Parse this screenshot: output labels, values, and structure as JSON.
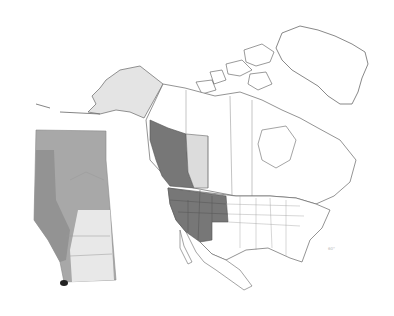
{
  "map": {
    "title": "",
    "region": "North America",
    "colors": {
      "background": "#ffffff",
      "land": "#ffffff",
      "border": "#888888",
      "range_primary": "#777777",
      "range_secondary": "#dcdcdc",
      "alaska": "#e4e4e4",
      "inset_forest": "#a8a8a8",
      "inset_mountain": "#939393",
      "inset_prairie": "#e8e8e8",
      "inset_occurrence": "#222222"
    },
    "range_regions": [
      "British Columbia",
      "Washington",
      "Oregon",
      "California",
      "Idaho",
      "Nevada",
      "Utah",
      "Arizona",
      "Montana",
      "Wyoming",
      "Colorado"
    ],
    "secondary_regions": [
      "Alberta",
      "Alaska"
    ],
    "inset": {
      "region": "Alberta",
      "occurrence": "southwest corner"
    },
    "scale_label": "60°"
  }
}
